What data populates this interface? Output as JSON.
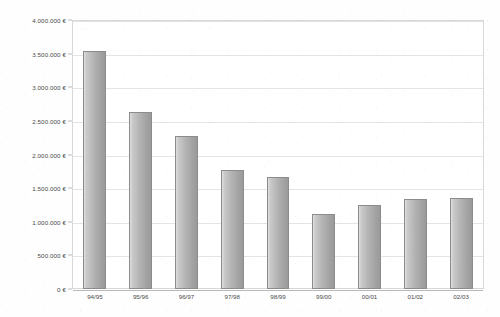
{
  "chart_data": {
    "type": "bar",
    "title": "",
    "xlabel": "",
    "ylabel": "",
    "categories": [
      "94/95",
      "95/96",
      "96/97",
      "97/98",
      "98/99",
      "99/00",
      "00/01",
      "01/02",
      "02/03"
    ],
    "values": [
      3540000,
      2630000,
      2275000,
      1770000,
      1665000,
      1115000,
      1250000,
      1340000,
      1355000
    ],
    "series": [
      {
        "name": "",
        "values": [
          3540000,
          2630000,
          2275000,
          1770000,
          1665000,
          1115000,
          1250000,
          1340000,
          1355000
        ]
      }
    ],
    "ylim": [
      0,
      4000000
    ],
    "ytick_values": [
      0,
      500000,
      1000000,
      1500000,
      2000000,
      2500000,
      3000000,
      3500000,
      4000000
    ],
    "ytick_labels": [
      "0 €",
      "500.000 €",
      "1.000.000 €",
      "1.500.000 €",
      "2.000.000 €",
      "2.500.000 €",
      "3.000.000 €",
      "3.500.000 €",
      "4.000.000 €"
    ],
    "currency_symbol": "€",
    "number_format": "european-dot-thousands",
    "grid": true,
    "grid_axis": "y",
    "legend": false,
    "legend_position": "none",
    "colors": {
      "bar_fill_light": "#dedede",
      "bar_fill_dark": "#9a9a9a",
      "bar_border": "#8c8c8c",
      "gridline": "#e4e4e4",
      "axis_line": "#b9b9b9",
      "plot_border": "#d8d8d8",
      "text": "#4a4a4a",
      "background": "#ffffff"
    }
  }
}
